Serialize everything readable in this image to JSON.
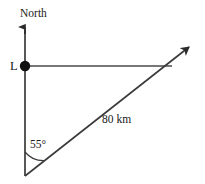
{
  "figure": {
    "type": "geometry-bearing-diagram",
    "background_color": "#ffffff",
    "stroke_color": "#3a3a3a",
    "text_color": "#1a1a1a"
  },
  "labels": {
    "north": "North",
    "point_l": "L",
    "angle": "55°",
    "distance": "80 km"
  },
  "geometry": {
    "point_l": {
      "x": 25,
      "y": 66
    },
    "north_arrow_tip": {
      "x": 25,
      "y": 26
    },
    "vertical_line_bottom": {
      "x": 25,
      "y": 176
    },
    "bottom_vertex": {
      "x": 25,
      "y": 176
    },
    "horizontal_line_end": {
      "x": 172,
      "y": 66
    },
    "diagonal_arrow_tip": {
      "x": 193,
      "y": 44
    },
    "angle_arc_radius": 24,
    "angle_value_degrees": 55,
    "distance_value_km": 80
  }
}
